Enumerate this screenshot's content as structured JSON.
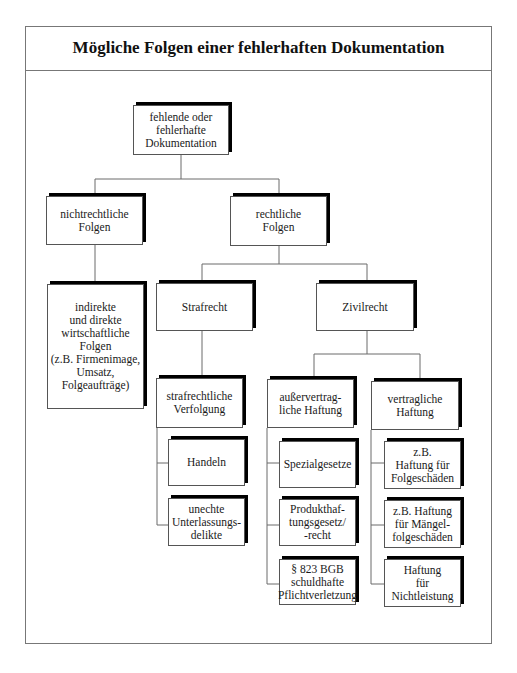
{
  "title": "Mögliche Folgen einer fehlerhaften Dokumentation",
  "nodes": {
    "root": "fehlende oder\nfehlerhafte\nDokumentation",
    "non_legal": "nichtrechtliche\nFolgen",
    "legal": "rechtliche\nFolgen",
    "economic": "indirekte\nund direkte\nwirtschaftliche\nFolgen\n(z.B. Firmenimage,\nUmsatz,\nFolgeaufträge)",
    "criminal_law": "Strafrecht",
    "civil_law": "Zivilrecht",
    "criminal_prosecution": "strafrechtliche\nVerfolgung",
    "acting": "Handeln",
    "omission": "unechte\nUnterlassungs-\ndelikte",
    "tort_liability": "außervertrag-\nliche Haftung",
    "contract_liability": "vertragliche\nHaftung",
    "special_laws": "Spezialgesetze",
    "product_liability": "Produkthaf-\ntungsgesetz/\n-recht",
    "bgb_823": "§ 823 BGB\nschuldhafte\nPflichtverletzung",
    "consequential_damage": "z.B.\nHaftung für\nFolgeschäden",
    "defect_damage": "z.B. Haftung\nfür Mängel-\nfolgeschäden",
    "non_performance": "Haftung\nfür\nNichtleistung"
  }
}
